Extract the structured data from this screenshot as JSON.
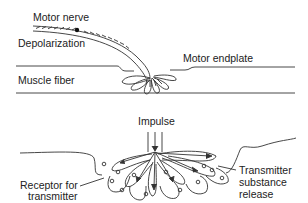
{
  "diagram": {
    "top_panel": {
      "labels": {
        "motor_nerve": "Motor nerve",
        "depolarization": "Depolarization",
        "motor_endplate": "Motor endplate",
        "muscle_fiber": "Muscle fiber"
      }
    },
    "bottom_panel": {
      "labels": {
        "impulse": "Impulse",
        "receptor_line1": "Receptor for",
        "receptor_line2": "transmitter",
        "transmitter_line1": "Transmitter",
        "transmitter_line2": "substance",
        "transmitter_line3": "release"
      }
    },
    "colors": {
      "line": "#333333",
      "background": "#ffffff"
    }
  }
}
